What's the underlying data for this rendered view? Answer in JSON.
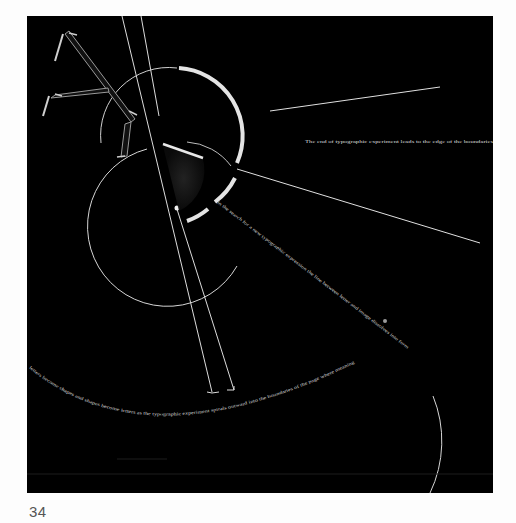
{
  "page": {
    "page_number": "34",
    "background": "#fdfdfd"
  },
  "artwork": {
    "plate_color": "#000000",
    "stroke_color": "#e6e6e6",
    "arc_highlight_color": "#e8e8e8",
    "letterform": "Y",
    "texts": {
      "right_caption": "The end of typographic experiment leads to the edge of the boundaries",
      "diagonal_line_text": "in the search for a new typographic expression the line between letter and image dissolves into form",
      "arc_text": "letters become shapes and shapes become letters as the typographic experiment spirals outward into the boundaries of the page where meaning drifts"
    }
  }
}
